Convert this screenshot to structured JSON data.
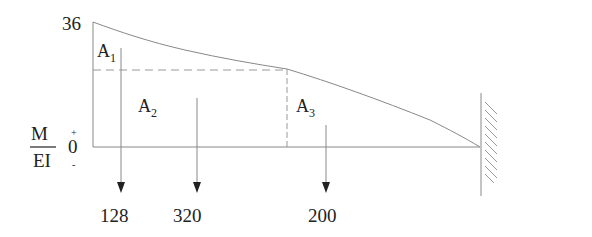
{
  "diagram": {
    "type": "M/EI diagram (cantilever beam)",
    "max_value_label": "36",
    "axis_label": {
      "numerator": "M",
      "denominator": "EI",
      "zero": "0",
      "plus": "+",
      "minus": "-"
    },
    "areas": [
      {
        "name": "A",
        "subscript": "1",
        "resultant": "128"
      },
      {
        "name": "A",
        "subscript": "2",
        "resultant": "320"
      },
      {
        "name": "A",
        "subscript": "3",
        "resultant": "200"
      }
    ],
    "support": "fixed-wall-right",
    "colors": {
      "line": "#7a7a7a",
      "text": "#222222",
      "arrow": "#222222"
    }
  }
}
